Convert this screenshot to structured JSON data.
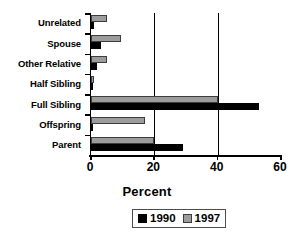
{
  "chart_data": {
    "type": "bar",
    "orientation": "horizontal",
    "title": "",
    "xlabel": "Percent",
    "ylabel": "",
    "xlim": [
      0,
      60
    ],
    "xticks": [
      0,
      20,
      40,
      60
    ],
    "xtick_labels": [
      "0",
      "20",
      "40",
      "60"
    ],
    "grid": "vertical gridlines at 20 and 40",
    "legend_position": "bottom-center",
    "categories": [
      "Unrelated",
      "Spouse",
      "Other Relative",
      "Half Sibling",
      "Full Sibling",
      "Offspring",
      "Parent"
    ],
    "series": [
      {
        "name": "1990",
        "color": "#000000",
        "values": [
          1,
          3,
          2,
          0.2,
          53,
          0.3,
          29
        ]
      },
      {
        "name": "1997",
        "color": "#9c9c9c",
        "values": [
          5,
          9.5,
          5,
          1,
          40,
          17,
          20
        ]
      }
    ]
  },
  "axis": {
    "x_title": "Percent"
  },
  "legend": {
    "entries": [
      {
        "label": "1990"
      },
      {
        "label": "1997"
      }
    ]
  }
}
